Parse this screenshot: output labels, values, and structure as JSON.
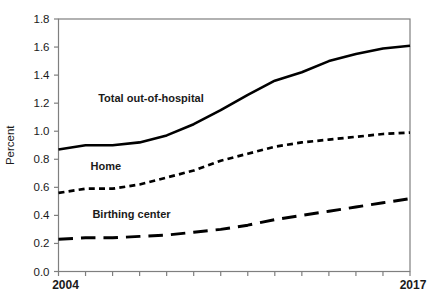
{
  "figure": {
    "background": "#ffffff",
    "line_color": "#000000",
    "text_color": "#1a1a1a",
    "frame_color": "#7f7f7f"
  },
  "chart_data": {
    "type": "line",
    "title": "",
    "xlabel": "",
    "ylabel": "Percent",
    "grid": false,
    "legend": "inline-annotations",
    "xlim": [
      2004,
      2017
    ],
    "ylim": [
      0.0,
      1.8
    ],
    "ytick_step": 0.2,
    "x": [
      2004,
      2005,
      2006,
      2007,
      2008,
      2009,
      2010,
      2011,
      2012,
      2013,
      2014,
      2015,
      2016,
      2017
    ],
    "x_axis_labels": [
      {
        "text": "2004",
        "year": 2004
      },
      {
        "text": "2017",
        "year": 2017
      }
    ],
    "series": [
      {
        "name": "Total out-of-hospital",
        "style": "solid",
        "values": [
          0.87,
          0.9,
          0.9,
          0.92,
          0.97,
          1.05,
          1.15,
          1.26,
          1.36,
          1.42,
          1.5,
          1.55,
          1.59,
          1.61
        ]
      },
      {
        "name": "Home",
        "style": "dashed",
        "values": [
          0.56,
          0.59,
          0.59,
          0.62,
          0.67,
          0.72,
          0.79,
          0.84,
          0.89,
          0.92,
          0.94,
          0.96,
          0.98,
          0.99
        ]
      },
      {
        "name": "Birthing center",
        "style": "long-dash",
        "values": [
          0.23,
          0.24,
          0.24,
          0.25,
          0.26,
          0.28,
          0.3,
          0.33,
          0.37,
          0.4,
          0.43,
          0.46,
          0.49,
          0.52
        ]
      }
    ],
    "annotations": [
      {
        "text": "Total out-of-hospital",
        "x": 2007.42,
        "y": 1.24
      },
      {
        "text": "Home",
        "x": 2005.75,
        "y": 0.755
      },
      {
        "text": "Birthing center",
        "x": 2006.7,
        "y": 0.41
      }
    ]
  }
}
